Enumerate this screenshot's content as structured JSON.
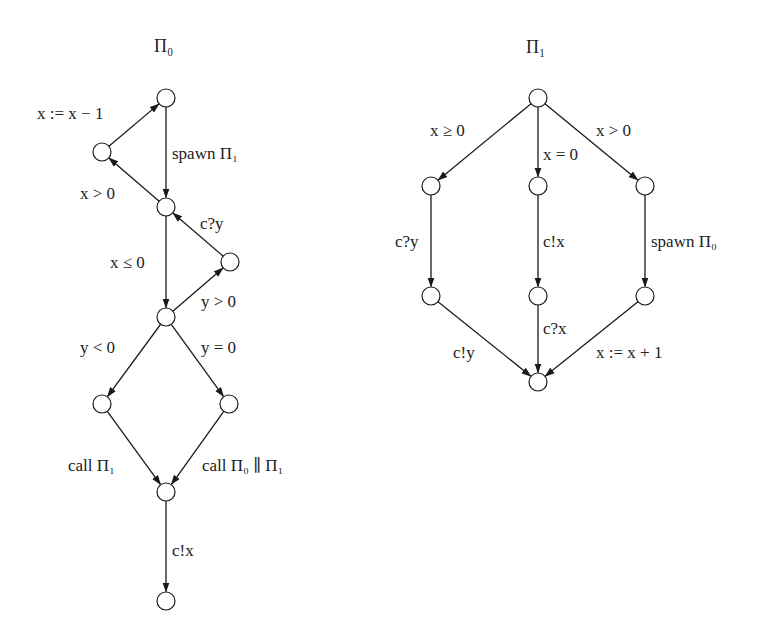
{
  "diagrams": [
    {
      "id": "pi0",
      "title": "Π₀",
      "title_pos": [
        154,
        46
      ],
      "nodes": [
        {
          "id": "n0",
          "x": 166,
          "y": 98
        },
        {
          "id": "n1",
          "x": 102,
          "y": 152
        },
        {
          "id": "n2",
          "x": 166,
          "y": 207
        },
        {
          "id": "n3",
          "x": 230,
          "y": 262
        },
        {
          "id": "n4",
          "x": 166,
          "y": 317
        },
        {
          "id": "n5",
          "x": 102,
          "y": 404
        },
        {
          "id": "n6",
          "x": 229,
          "y": 404
        },
        {
          "id": "n7",
          "x": 166,
          "y": 492
        },
        {
          "id": "n8",
          "x": 166,
          "y": 601
        }
      ],
      "edges": [
        {
          "from": "n1",
          "to": "n0",
          "label": "x := x − 1",
          "label_pos": [
            37,
            113
          ]
        },
        {
          "from": "n0",
          "to": "n2",
          "label": "spawn Π₁",
          "label_pos": [
            172,
            153
          ]
        },
        {
          "from": "n2",
          "to": "n1",
          "label": "x > 0",
          "label_pos": [
            80,
            193
          ]
        },
        {
          "from": "n3",
          "to": "n2",
          "label": "c?y",
          "label_pos": [
            200,
            223
          ]
        },
        {
          "from": "n2",
          "to": "n4",
          "label": "x ≤ 0",
          "label_pos": [
            110,
            262
          ]
        },
        {
          "from": "n4",
          "to": "n3",
          "label": "y > 0",
          "label_pos": [
            201,
            301
          ]
        },
        {
          "from": "n4",
          "to": "n5",
          "label": "y < 0",
          "label_pos": [
            80,
            347
          ]
        },
        {
          "from": "n4",
          "to": "n6",
          "label": "y = 0",
          "label_pos": [
            201,
            347
          ]
        },
        {
          "from": "n5",
          "to": "n7",
          "label": "call Π₁",
          "label_pos": [
            68,
            465
          ]
        },
        {
          "from": "n6",
          "to": "n7",
          "label": "call Π₀ ∥ Π₁",
          "label_pos": [
            202,
            465
          ]
        },
        {
          "from": "n7",
          "to": "n8",
          "label": "c!x",
          "label_pos": [
            172,
            550
          ]
        }
      ]
    },
    {
      "id": "pi1",
      "title": "Π₁",
      "title_pos": [
        526,
        47
      ],
      "nodes": [
        {
          "id": "m0",
          "x": 538,
          "y": 98
        },
        {
          "id": "m1",
          "x": 431,
          "y": 186
        },
        {
          "id": "m2",
          "x": 538,
          "y": 186
        },
        {
          "id": "m3",
          "x": 645,
          "y": 186
        },
        {
          "id": "m4",
          "x": 431,
          "y": 296
        },
        {
          "id": "m5",
          "x": 538,
          "y": 296
        },
        {
          "id": "m6",
          "x": 645,
          "y": 296
        },
        {
          "id": "m7",
          "x": 538,
          "y": 382
        }
      ],
      "edges": [
        {
          "from": "m0",
          "to": "m1",
          "label": "x ≥ 0",
          "label_pos": [
            430,
            130
          ]
        },
        {
          "from": "m0",
          "to": "m2",
          "label": "x = 0",
          "label_pos": [
            543,
            154
          ]
        },
        {
          "from": "m0",
          "to": "m3",
          "label": "x > 0",
          "label_pos": [
            596,
            130
          ]
        },
        {
          "from": "m1",
          "to": "m4",
          "label": "c?y",
          "label_pos": [
            395,
            241
          ]
        },
        {
          "from": "m2",
          "to": "m5",
          "label": "c!x",
          "label_pos": [
            543,
            241
          ]
        },
        {
          "from": "m3",
          "to": "m6",
          "label": "spawn Π₀",
          "label_pos": [
            651,
            241
          ]
        },
        {
          "from": "m4",
          "to": "m7",
          "label": "c!y",
          "label_pos": [
            453,
            352
          ]
        },
        {
          "from": "m5",
          "to": "m7",
          "label": "c?x",
          "label_pos": [
            543,
            328
          ]
        },
        {
          "from": "m6",
          "to": "m7",
          "label": "x := x + 1",
          "label_pos": [
            596,
            352
          ]
        }
      ]
    }
  ],
  "style": {
    "node_radius": 9,
    "stroke_color": "#1a1a1a",
    "background": "#ffffff"
  }
}
